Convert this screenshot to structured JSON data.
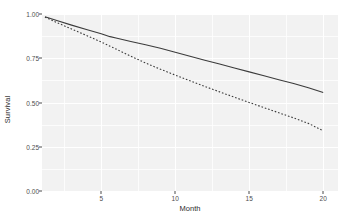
{
  "chart_data": {
    "type": "line",
    "title": "",
    "subtitle": "",
    "xlabel": "Month",
    "ylabel": "Survival",
    "xlim": [
      1,
      21
    ],
    "ylim": [
      0.0,
      1.0
    ],
    "grid": true,
    "legend": "none",
    "x_ticks": [
      5,
      10,
      15,
      20
    ],
    "x_tick_labels": [
      "5",
      "10",
      "15",
      "20"
    ],
    "x_minor_ticks": [
      2.5,
      7.5,
      12.5,
      17.5
    ],
    "y_ticks": [
      0.0,
      0.25,
      0.5,
      0.75,
      1.0
    ],
    "y_tick_labels": [
      "0.00",
      "0.25",
      "0.50",
      "0.75",
      "1.00"
    ],
    "y_minor_ticks": [
      0.125,
      0.375,
      0.625,
      0.875
    ],
    "panel_background": "#f2f2f2",
    "grid_color": "#ffffff",
    "line_color": "#3b3b3b",
    "series": [
      {
        "name": "solid-curve",
        "linestyle": "solid",
        "x": [
          1.2,
          2,
          3,
          4,
          5,
          5.6,
          6,
          7,
          8,
          9,
          10,
          11,
          12,
          13,
          14,
          15,
          16,
          17,
          18,
          19,
          20
        ],
        "values": [
          0.985,
          0.963,
          0.937,
          0.912,
          0.888,
          0.872,
          0.864,
          0.845,
          0.826,
          0.806,
          0.784,
          0.761,
          0.739,
          0.717,
          0.695,
          0.673,
          0.651,
          0.629,
          0.607,
          0.583,
          0.556
        ]
      },
      {
        "name": "dashed-curve",
        "linestyle": "dashed",
        "x": [
          1.2,
          2,
          3,
          4,
          5,
          5.6,
          6,
          7,
          8,
          9,
          10,
          11,
          12,
          13,
          14,
          15,
          16,
          17,
          18,
          19,
          20
        ],
        "values": [
          0.982,
          0.952,
          0.915,
          0.879,
          0.842,
          0.818,
          0.802,
          0.762,
          0.723,
          0.688,
          0.655,
          0.623,
          0.591,
          0.56,
          0.53,
          0.5,
          0.471,
          0.442,
          0.413,
          0.382,
          0.34
        ]
      }
    ]
  },
  "axes": {
    "x_title": "Month",
    "y_title": "Survival"
  }
}
